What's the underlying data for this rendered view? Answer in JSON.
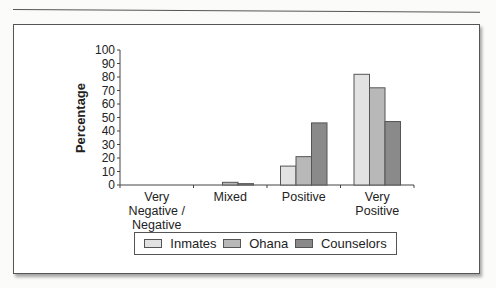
{
  "chart_data": {
    "type": "bar",
    "title": "",
    "xlabel": "",
    "ylabel": "Percentage",
    "ylim": [
      0,
      100
    ],
    "yticks": [
      0,
      10,
      20,
      30,
      40,
      50,
      60,
      70,
      80,
      90,
      100
    ],
    "categories": [
      [
        "Very",
        "Negative /",
        "Negative"
      ],
      [
        "Mixed"
      ],
      [
        "Positive"
      ],
      [
        "Very",
        "Positive"
      ]
    ],
    "category_labels": [
      "Very Negative / Negative",
      "Mixed",
      "Positive",
      "Very Positive"
    ],
    "series": [
      {
        "name": "Inmates",
        "color": "#e2e2e2",
        "values": [
          0,
          0,
          14,
          82
        ]
      },
      {
        "name": "Ohana",
        "color": "#b8b8b8",
        "values": [
          0,
          2,
          21,
          72
        ]
      },
      {
        "name": "Counselors",
        "color": "#8a8a8a",
        "values": [
          0,
          1,
          46,
          47
        ]
      }
    ],
    "grid": false,
    "legend_position": "bottom"
  },
  "legend": {
    "items": [
      "Inmates",
      "Ohana",
      "Counselors"
    ]
  }
}
